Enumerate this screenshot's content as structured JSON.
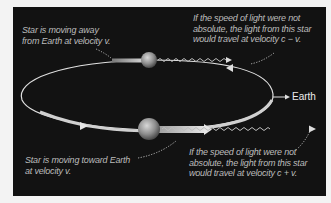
{
  "diagram": {
    "labels": {
      "star_away": "Star is moving away\nfrom Earth at velocity v.",
      "light_away": "If the speed of light were not\nabsolute, the light from this star\nwould travel at velocity c − v.",
      "earth": "Earth",
      "star_toward": "Star is moving toward  Earth\nat velocity v.",
      "light_toward": "If the speed of light were not\nabsolute, the light from this star\nwould travel at velocity  c + v."
    },
    "elements": {
      "orbit": "elliptical-orbit",
      "stars": [
        "star-receding",
        "star-approaching"
      ],
      "light_waves": [
        "wave-c-minus-v",
        "wave-c-plus-v"
      ]
    },
    "colors": {
      "background": "#121212",
      "caption": "#bcbcbc",
      "orbit": "#e0e0e0",
      "star": "#9a9a9a"
    }
  }
}
